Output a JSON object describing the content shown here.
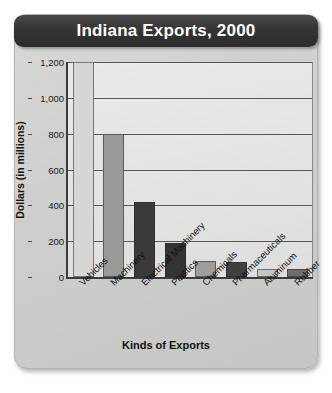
{
  "chart_data": {
    "type": "bar",
    "title": "Indiana Exports, 2000",
    "xlabel": "Kinds of Exports",
    "ylabel": "Dollars (in millions)",
    "categories": [
      "Vehicles",
      "Machinery",
      "Electrical Machinery",
      "Plastics",
      "Chemicals",
      "Pharmaceuticals",
      "Aluminum",
      "Rubber"
    ],
    "values": [
      1200,
      800,
      420,
      190,
      90,
      85,
      45,
      45
    ],
    "ylim": [
      0,
      1200
    ],
    "yticks": [
      0,
      200,
      400,
      600,
      800,
      1000,
      1200
    ],
    "ytick_labels": [
      "0",
      "200",
      "400",
      "600",
      "800",
      "1,000",
      "1,200"
    ],
    "grid": true,
    "legend": "none",
    "bar_colors": [
      "#d6d6d4",
      "#9a9a98",
      "#3a3a3a",
      "#333333",
      "#9e9e9c",
      "#3f3f3f",
      "#c4c4c2",
      "#6e6e6c"
    ]
  },
  "colors": {
    "title_bar": "#2c2c2c",
    "title_text": "#ffffff",
    "card_background": "#d2d2d0",
    "plot_background": "#e6e6e4",
    "axis": "#3c3c3c",
    "gridline": "#575757"
  }
}
